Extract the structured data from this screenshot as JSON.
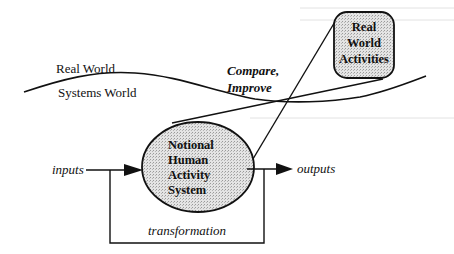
{
  "diagram": {
    "type": "soft-systems-model",
    "colors": {
      "ink": "#111111",
      "fill": "#d9d9d9",
      "background": "#ffffff"
    },
    "boundary": {
      "upper_label": "Real World",
      "lower_label": "Systems World"
    },
    "comparison_label_line1": "Compare,",
    "comparison_label_line2": "Improve",
    "real_world_box": {
      "line1": "Real",
      "line2": "World",
      "line3": "Activities"
    },
    "system_ellipse": {
      "line1": "Notional",
      "line2": "Human",
      "line3": "Activity",
      "line4": "System"
    },
    "inputs_label": "inputs",
    "outputs_label": "outputs",
    "feedback_label": "transformation"
  }
}
